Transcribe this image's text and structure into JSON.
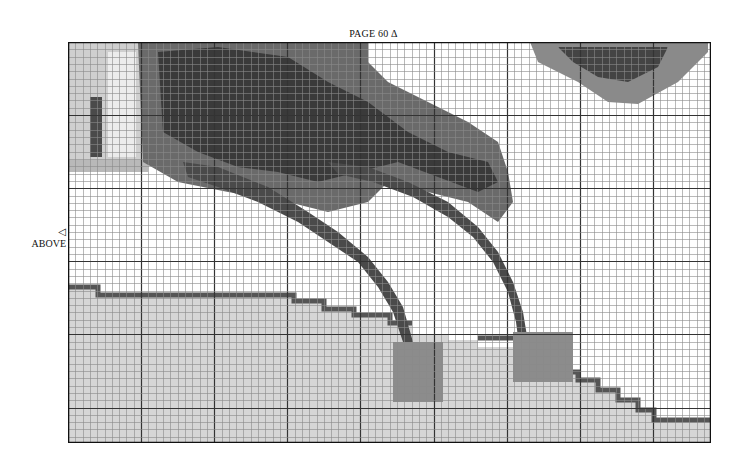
{
  "page": {
    "label": "PAGE 60",
    "label_marker": "Δ",
    "side_marker": "◁",
    "side_label": "ABOVE"
  },
  "chart_grid": {
    "columns": 88,
    "rows": 55,
    "cell_size_px": 7.31,
    "major_every": 10,
    "line_color_minor": "#8a8a8a",
    "line_color_major": "#333333",
    "border_color": "#111111"
  },
  "palette": {
    "background": "#ffffff",
    "light": "#d9d9d9",
    "mid": "#a8a8a8",
    "dark": "#5a5a5a",
    "darkest": "#2e2e2e"
  }
}
